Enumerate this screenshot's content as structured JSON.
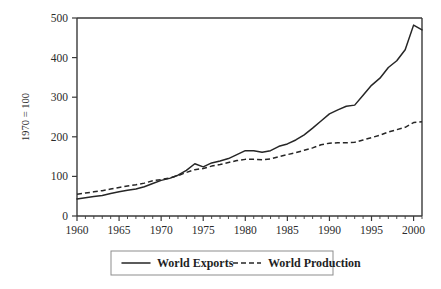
{
  "chart_data": {
    "type": "line",
    "title": "",
    "subtitle": "",
    "xlabel": "",
    "ylabel": "1970 = 100",
    "xlim": [
      1960,
      2001
    ],
    "ylim": [
      0,
      500
    ],
    "grid": false,
    "legend_position": "bottom-center",
    "y_ticks": [
      0,
      100,
      200,
      300,
      400,
      500
    ],
    "y_tick_labels": [
      "0",
      "100",
      "200",
      "300",
      "400",
      "500"
    ],
    "x_ticks": [
      1960,
      1965,
      1970,
      1975,
      1980,
      1985,
      1990,
      1995,
      2000
    ],
    "x_tick_labels": [
      "1960",
      "1965",
      "1970",
      "1975",
      "1980",
      "1985",
      "1990",
      "1995",
      "2000"
    ],
    "x_minor_tick_step": 1,
    "x": [
      1960,
      1961,
      1962,
      1963,
      1964,
      1965,
      1966,
      1967,
      1968,
      1969,
      1970,
      1971,
      1972,
      1973,
      1974,
      1975,
      1976,
      1977,
      1978,
      1979,
      1980,
      1981,
      1982,
      1983,
      1984,
      1985,
      1986,
      1987,
      1988,
      1989,
      1990,
      1991,
      1992,
      1993,
      1994,
      1995,
      1996,
      1997,
      1998,
      1999,
      2000,
      2001
    ],
    "series": [
      {
        "name": "World Exports",
        "style": "solid",
        "color": "#262626",
        "values": [
          43,
          46,
          49,
          52,
          57,
          61,
          65,
          68,
          74,
          82,
          90,
          95,
          103,
          115,
          132,
          124,
          134,
          139,
          145,
          155,
          165,
          165,
          161,
          165,
          176,
          182,
          192,
          205,
          222,
          240,
          258,
          268,
          277,
          280,
          305,
          330,
          348,
          375,
          392,
          420,
          482,
          470
        ]
      },
      {
        "name": "World Production",
        "style": "dashed",
        "color": "#262626",
        "values": [
          55,
          58,
          61,
          64,
          68,
          72,
          76,
          79,
          83,
          89,
          92,
          96,
          102,
          110,
          117,
          120,
          126,
          130,
          135,
          140,
          143,
          143,
          142,
          144,
          150,
          155,
          160,
          166,
          172,
          180,
          184,
          185,
          185,
          186,
          192,
          198,
          204,
          212,
          218,
          224,
          236,
          238
        ]
      }
    ],
    "legend": [
      {
        "label": "World Exports",
        "style": "solid"
      },
      {
        "label": "World Production",
        "style": "dashed"
      }
    ]
  }
}
